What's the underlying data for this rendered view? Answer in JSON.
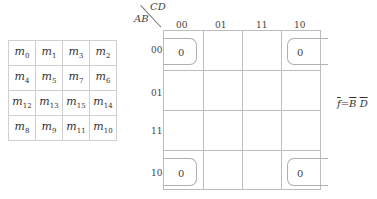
{
  "minterm_table": {
    "rows": [
      [
        "0",
        "1",
        "3",
        "2"
      ],
      [
        "4",
        "5",
        "7",
        "6"
      ],
      [
        "12",
        "13",
        "15",
        "14"
      ],
      [
        "8",
        "9",
        "11",
        "10"
      ]
    ],
    "symbol": "m"
  },
  "kmap": {
    "row_var": "AB",
    "col_var": "CD",
    "col_labels": [
      "00",
      "01",
      "11",
      "10"
    ],
    "row_labels": [
      "00",
      "01",
      "11",
      "10"
    ],
    "cells": [
      {
        "row": "00",
        "col": "00",
        "value": "0"
      },
      {
        "row": "00",
        "col": "10",
        "value": "0"
      },
      {
        "row": "10",
        "col": "00",
        "value": "0"
      },
      {
        "row": "10",
        "col": "10",
        "value": "0"
      }
    ]
  },
  "formula": {
    "lhs": "f",
    "eq": "=",
    "t1": "B",
    "t2": "D"
  }
}
